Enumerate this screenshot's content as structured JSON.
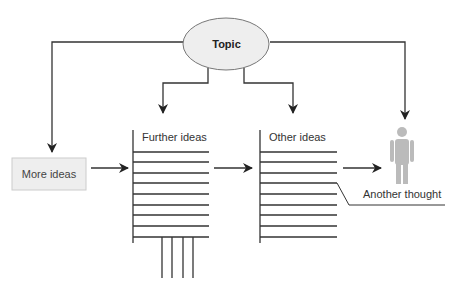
{
  "diagram": {
    "topic": {
      "label": "Topic",
      "fill": "#eeeeee"
    },
    "more_ideas": {
      "label": "More ideas",
      "fill": "#eeeeee"
    },
    "further_ideas": {
      "label": "Further ideas"
    },
    "other_ideas": {
      "label": "Other ideas"
    },
    "another_thought": {
      "label": "Another thought"
    },
    "person": {
      "color": "#bbbbbb"
    },
    "line_color": "#333333"
  }
}
